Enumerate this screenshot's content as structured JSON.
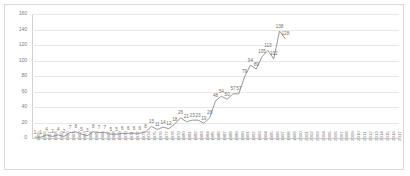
{
  "chart_data": {
    "type": "line",
    "title": "",
    "subtitle": "",
    "xlabel": "",
    "ylabel": "",
    "ylim": [
      0,
      160
    ],
    "ytick_step": 20,
    "yticks": [
      0,
      20,
      40,
      60,
      80,
      100,
      120,
      140,
      160
    ],
    "grid": true,
    "legend": false,
    "legend_position": "none",
    "line_color": "#8c8c8c",
    "data_labels": true,
    "categories": [
      "1955",
      "1956",
      "1957",
      "1958",
      "1959",
      "1960",
      "1961",
      "1962",
      "1963",
      "1964",
      "1965",
      "1966",
      "1967",
      "1968",
      "1969",
      "1970",
      "1971",
      "1972",
      "1973",
      "1974",
      "1975",
      "1976",
      "1977",
      "1978",
      "1979",
      "1980",
      "1981",
      "1982",
      "1983",
      "1984",
      "1985",
      "1986",
      "1987",
      "1988",
      "1989",
      "1990",
      "1991",
      "1992",
      "1993",
      "1994",
      "1995",
      "1996",
      "1997",
      "1998",
      "1999",
      "2000",
      "2001",
      "2002",
      "2003",
      "2004",
      "2005",
      "2006",
      "2007",
      "2008",
      "2009",
      "2010",
      "2011",
      "2012",
      "2013",
      "2014",
      "2015",
      "2016",
      "2017"
    ],
    "values": [
      1,
      1,
      4,
      2,
      4,
      2,
      7,
      8,
      5,
      3,
      8,
      7,
      7,
      5,
      5,
      6,
      6,
      6,
      6,
      8,
      15,
      11,
      14,
      12,
      18,
      26,
      21,
      23,
      23,
      19,
      26,
      48,
      54,
      50,
      57,
      57,
      79,
      94,
      89,
      105,
      113,
      102,
      138,
      128,
      null,
      null,
      null,
      null,
      null,
      null,
      null,
      null,
      null,
      null,
      null,
      null,
      null,
      null,
      null,
      null,
      null,
      null,
      null
    ]
  }
}
